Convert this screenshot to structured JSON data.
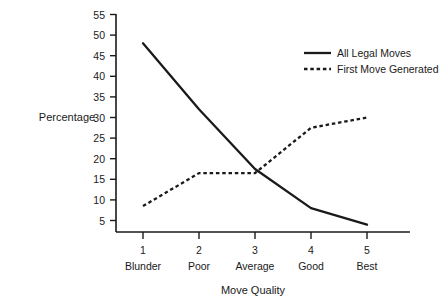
{
  "chart_data": {
    "type": "line",
    "title": "",
    "xlabel": "Move Quality",
    "ylabel": "Percentage",
    "x": [
      1,
      2,
      3,
      4,
      5
    ],
    "categories": [
      "Blunder",
      "Poor",
      "Average",
      "Good",
      "Best"
    ],
    "xtick_labels": [
      "1",
      "2",
      "3",
      "4",
      "5"
    ],
    "ytick_labels": [
      "5",
      "10",
      "15",
      "20",
      "25",
      "30",
      "35",
      "40",
      "45",
      "50",
      "55"
    ],
    "ytick_values": [
      5,
      10,
      15,
      20,
      25,
      30,
      35,
      40,
      45,
      50,
      55
    ],
    "ylim": [
      0,
      55
    ],
    "xlim": [
      0.6,
      5.4
    ],
    "grid": false,
    "legend_position": "upper-right",
    "series": [
      {
        "name": "All Legal Moves",
        "style": "solid",
        "color": "#1a1a1a",
        "values": [
          48,
          32,
          17.5,
          8,
          4
        ]
      },
      {
        "name": "First Move Generated",
        "style": "dashed",
        "color": "#1a1a1a",
        "values": [
          8.5,
          16.5,
          16.5,
          27.5,
          30
        ]
      }
    ]
  },
  "axis": {
    "y_title": "Percentage",
    "x_title": "Move Quality"
  },
  "legend": {
    "entries": [
      {
        "label": "All Legal Moves",
        "style": "solid"
      },
      {
        "label": "First Move Generated",
        "style": "dashed"
      }
    ]
  },
  "ticks": {
    "y": [
      "55",
      "50",
      "45",
      "40",
      "35",
      "30",
      "25",
      "20",
      "15",
      "10",
      "5"
    ],
    "x_numbers": [
      "1",
      "2",
      "3",
      "4",
      "5"
    ],
    "x_names": [
      "Blunder",
      "Poor",
      "Average",
      "Good",
      "Best"
    ]
  }
}
